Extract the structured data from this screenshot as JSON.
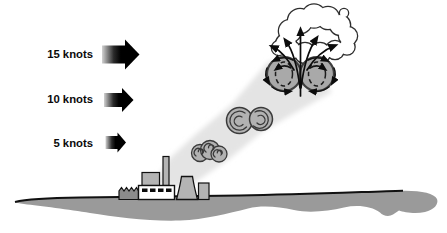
{
  "diagram": {
    "wind_speeds": [
      {
        "label": "15 knots"
      },
      {
        "label": "10 knots"
      },
      {
        "label": "5 knots"
      }
    ]
  },
  "colors": {
    "background": "#ffffff",
    "outline": "#111111",
    "arrow_black": "#000000",
    "arrow_fade_start": "#d2d2d2",
    "ground": "#9a9a9a",
    "building_light": "#b4b4b4",
    "building_dark": "#8b8b8b",
    "building_white": "#ffffff",
    "plume": "#e4e4e4",
    "puff_fill": "#b2b2b2",
    "puff_line": "#3a3a3a",
    "vortex_fill": "#a9a9a9",
    "cloud_fill": "#ffffff"
  },
  "icons": {
    "wind-arrow-icon": "➡"
  }
}
